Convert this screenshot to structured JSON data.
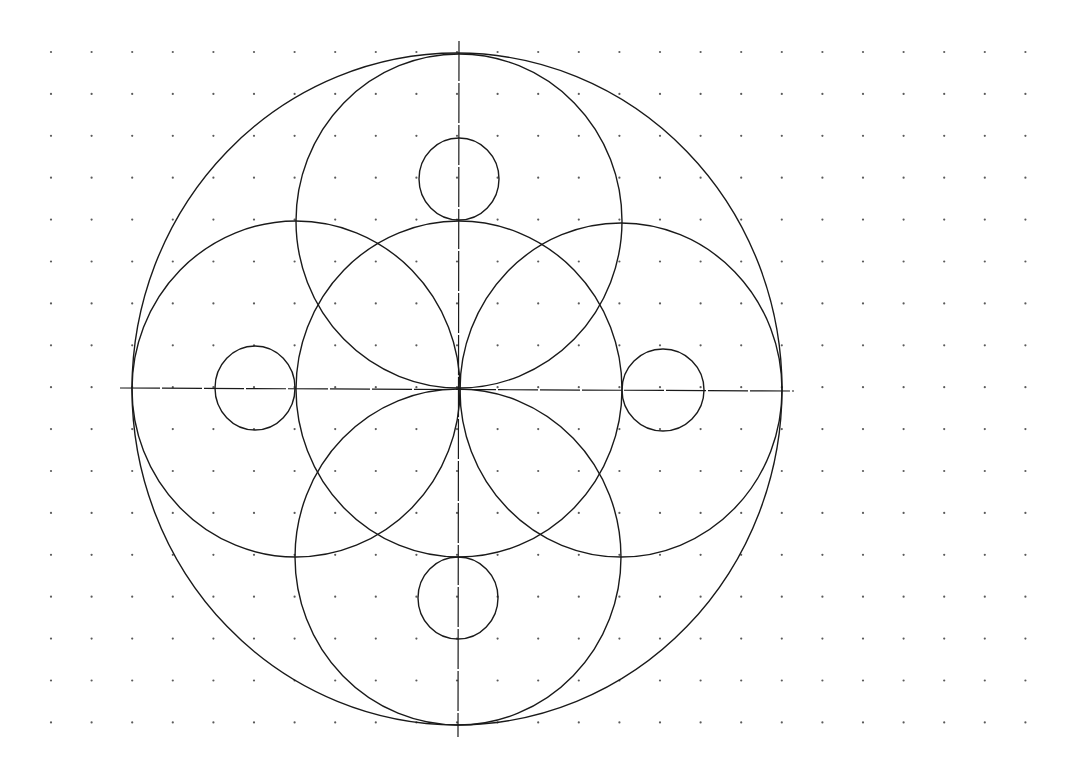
{
  "canvas": {
    "width": 1073,
    "height": 775,
    "background": "#ffffff",
    "stroke_color": "#1a1a1a",
    "dot_color": "#5a5a5a"
  },
  "grid": {
    "x0": 51,
    "y0": 52,
    "dx": 40.6,
    "dy": 41.9,
    "cols": 25,
    "rows": 17,
    "dot_radius": 1.1
  },
  "axes": {
    "horizontal": {
      "x1": 120,
      "y1": 388,
      "x2": 794,
      "y2": 391,
      "dash": "40 2"
    },
    "vertical": {
      "x1": 459,
      "y1": 41,
      "x2": 458,
      "y2": 737,
      "dash": "40 2"
    }
  },
  "shapes": [
    {
      "name": "outer-circle",
      "cx": 457,
      "cy": 389,
      "rx": 325,
      "ry": 336
    },
    {
      "name": "center-circle",
      "cx": 459,
      "cy": 389,
      "rx": 163,
      "ry": 168
    },
    {
      "name": "top-circle",
      "cx": 459,
      "cy": 221,
      "rx": 163,
      "ry": 167
    },
    {
      "name": "bottom-circle",
      "cx": 458,
      "cy": 557,
      "rx": 163,
      "ry": 168
    },
    {
      "name": "left-circle",
      "cx": 296,
      "cy": 389,
      "rx": 164,
      "ry": 168
    },
    {
      "name": "right-circle",
      "cx": 621,
      "cy": 390,
      "rx": 161,
      "ry": 167
    },
    {
      "name": "top-small-circle",
      "cx": 459,
      "cy": 179,
      "rx": 40,
      "ry": 41
    },
    {
      "name": "bottom-small-circle",
      "cx": 458,
      "cy": 598,
      "rx": 40,
      "ry": 41
    },
    {
      "name": "left-small-circle",
      "cx": 255,
      "cy": 388,
      "rx": 40,
      "ry": 42
    },
    {
      "name": "right-small-circle",
      "cx": 663,
      "cy": 390,
      "rx": 41,
      "ry": 41
    }
  ]
}
